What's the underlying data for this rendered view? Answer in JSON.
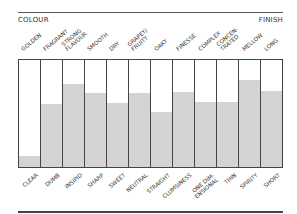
{
  "chart_data": {
    "type": "bar",
    "title": "",
    "left_header": "COLOUR",
    "right_header": "FINISH",
    "top_labels": [
      "GOLDEN",
      "FRAGRANT",
      "STRONG\nFLAVOUR",
      "SMOOTH",
      "DRY",
      "GRAPEY/\nFRUITY",
      "OAKY",
      "FINESSE",
      "COMPLEX",
      "CONCEN-\nTRATED",
      "MELLOW",
      "LONG"
    ],
    "bottom_labels": [
      "CLEAR",
      "DUMB",
      "INSIPID",
      "SHARP",
      "SWEET",
      "NEUTRAL",
      "STRAIGHT",
      "CLUMSINESS",
      "ONE DIM-\nENSIONAL",
      "THIN",
      "SPIRITY",
      "SHORT"
    ],
    "values": [
      10,
      59,
      78,
      69,
      60,
      69,
      51,
      70,
      61,
      61,
      81,
      71
    ],
    "ylim": [
      0,
      100
    ],
    "grid": false,
    "fill_color": "#d3d3d3",
    "border_color": "#444444"
  }
}
